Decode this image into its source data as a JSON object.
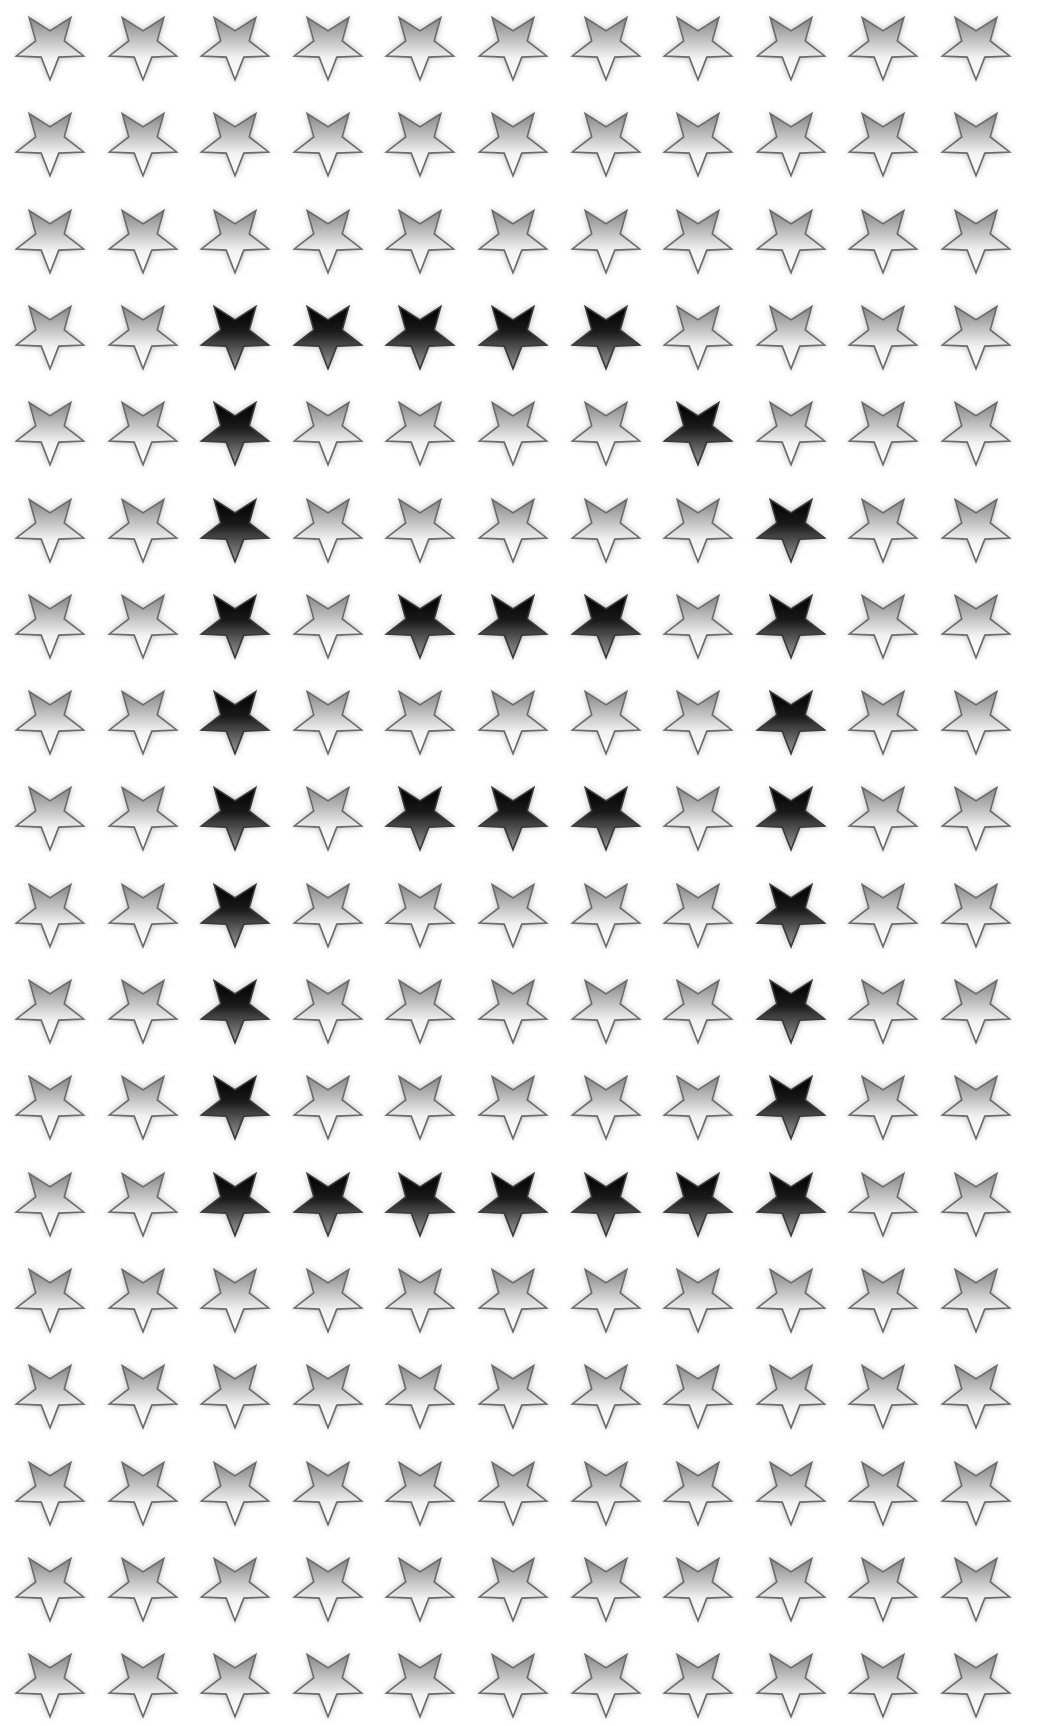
{
  "grid": {
    "title": "Star grid pattern",
    "columns": 11,
    "rows": 18,
    "origin_x": 50,
    "origin_y": 17,
    "col_pitch": 92.6,
    "row_pitch": 96.3,
    "star_width": 68,
    "star_height": 66,
    "star_shape": "inverted-five-point-star",
    "light_star": {
      "name": "light-star-icon",
      "gradient_top": "#858585",
      "gradient_bottom": "#ffffff",
      "outline": "#6a6a6a"
    },
    "dark_star": {
      "name": "dark-star-icon",
      "gradient_top": "#000000",
      "gradient_bottom": "#8a8a8a",
      "outline": "#3a3a3a"
    },
    "background": "#ffffff",
    "highlighted_cells": {
      "4": [
        3,
        4,
        5,
        6,
        7
      ],
      "5": [
        3,
        8
      ],
      "6": [
        3,
        9
      ],
      "7": [
        3,
        5,
        6,
        7,
        9
      ],
      "8": [
        3,
        9
      ],
      "9": [
        3,
        5,
        6,
        7,
        9
      ],
      "10": [
        3,
        9
      ],
      "11": [
        3,
        9
      ],
      "12": [
        3,
        9
      ],
      "13": [
        3,
        4,
        5,
        6,
        7,
        8,
        9
      ]
    },
    "total_stars": 198,
    "dark_star_count": 34
  }
}
